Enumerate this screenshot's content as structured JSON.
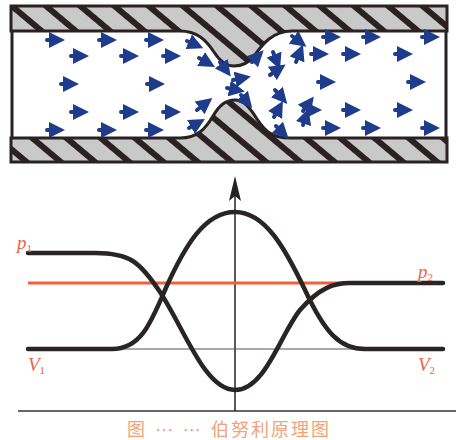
{
  "figure": {
    "type": "venturi-flow-diagram",
    "pipe": {
      "flow_direction": "left-to-right",
      "particle_color": "#1f3b8c",
      "wall_fill": "#c9c9c9",
      "wall_hatch": "#2a2222",
      "throat_center_x": 235
    },
    "graph": {
      "axis": "vertical-arrow-at-throat",
      "curves": [
        {
          "name": "pressure",
          "shape": "high-left, dips at throat, recovers right",
          "start_label": "p1",
          "end_label": "p2"
        },
        {
          "name": "velocity",
          "shape": "low-left, peaks at throat, returns right",
          "start_label": "V1",
          "end_label": "V2"
        }
      ],
      "reference_lines": [
        {
          "name": "p2-level",
          "color": "#f2603a"
        },
        {
          "name": "V-level",
          "color": "#555555"
        }
      ]
    },
    "labels": {
      "p1": {
        "letter": "p",
        "sub": "1"
      },
      "p2": {
        "letter": "p",
        "sub": "2"
      },
      "v1": {
        "letter": "V",
        "sub": "1"
      },
      "v2": {
        "letter": "V",
        "sub": "2"
      }
    },
    "caption": "图 ⋯ ⋯ 伯努利原理图"
  },
  "colors": {
    "label": "#e8664a",
    "red_line": "#f2603a",
    "curve": "#2a2424",
    "particle": "#1f3b8c"
  }
}
